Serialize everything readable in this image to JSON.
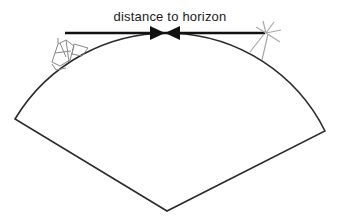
{
  "diagram": {
    "label": "distance to horizon",
    "elements": {
      "ship": "ship-icon",
      "lighthouse_light": "light-burst-icon",
      "earth_sector": "earth-curvature-sector",
      "arrows": "converging-arrows"
    },
    "colors": {
      "line": "#1a1a1a",
      "icon_stroke": "#999999",
      "background": "#ffffff"
    }
  }
}
